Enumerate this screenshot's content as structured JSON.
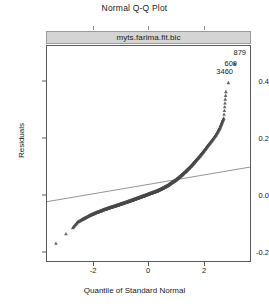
{
  "title": "Normal Q-Q Plot",
  "strip": {
    "label": "myts.farima.fit.bic"
  },
  "axes": {
    "ylabel": "Residuals",
    "xlabel": "Quantile of Standard Normal",
    "yticks": [
      "0.4",
      "0.2",
      "0.0",
      "-0.2"
    ],
    "xticks": [
      "-2",
      "0",
      "2"
    ]
  },
  "point_labels": [
    {
      "text": "879"
    },
    {
      "text": "609"
    },
    {
      "text": "3460"
    }
  ],
  "chart_data": {
    "type": "scatter",
    "title": "Normal Q-Q Plot",
    "subtitle": "myts.farima.fit.bic",
    "xlabel": "Quantile of Standard Normal",
    "ylabel": "Residuals",
    "xlim": [
      -3.75,
      3.75
    ],
    "ylim": [
      -0.27,
      0.52
    ],
    "xticks": [
      -2,
      0,
      2
    ],
    "yticks": [
      -0.2,
      0.0,
      0.2,
      0.4
    ],
    "grid": false,
    "legend": null,
    "marker": "triangle",
    "marker_color": "#4a4a4a",
    "reference_line": {
      "type": "qqline",
      "x": [
        -3.75,
        3.75
      ],
      "y": [
        -0.052,
        0.075
      ],
      "color": "#7a7a7a"
    },
    "labeled_points": [
      {
        "label": "879",
        "x": 3.18,
        "y": 0.455
      },
      {
        "label": "609",
        "x": 2.95,
        "y": 0.385
      },
      {
        "label": "3460",
        "x": 2.86,
        "y": 0.352
      }
    ],
    "points": [
      {
        "x": -3.42,
        "y": -0.205
      },
      {
        "x": -3.05,
        "y": -0.17
      },
      {
        "x": -2.8,
        "y": -0.148
      },
      {
        "x": -2.62,
        "y": -0.127
      },
      {
        "x": -2.47,
        "y": -0.118
      },
      {
        "x": -2.35,
        "y": -0.112
      },
      {
        "x": -2.24,
        "y": -0.106
      },
      {
        "x": -2.14,
        "y": -0.101
      },
      {
        "x": -2.05,
        "y": -0.097
      },
      {
        "x": -1.96,
        "y": -0.093
      },
      {
        "x": -1.88,
        "y": -0.09
      },
      {
        "x": -1.8,
        "y": -0.087
      },
      {
        "x": -1.72,
        "y": -0.084
      },
      {
        "x": -1.65,
        "y": -0.081
      },
      {
        "x": -1.58,
        "y": -0.079
      },
      {
        "x": -1.51,
        "y": -0.076
      },
      {
        "x": -1.44,
        "y": -0.074
      },
      {
        "x": -1.38,
        "y": -0.072
      },
      {
        "x": -1.31,
        "y": -0.07
      },
      {
        "x": -1.25,
        "y": -0.068
      },
      {
        "x": -1.19,
        "y": -0.066
      },
      {
        "x": -1.13,
        "y": -0.064
      },
      {
        "x": -1.07,
        "y": -0.062
      },
      {
        "x": -1.01,
        "y": -0.06
      },
      {
        "x": -0.95,
        "y": -0.058
      },
      {
        "x": -0.89,
        "y": -0.056
      },
      {
        "x": -0.83,
        "y": -0.054
      },
      {
        "x": -0.77,
        "y": -0.052
      },
      {
        "x": -0.72,
        "y": -0.05
      },
      {
        "x": -0.66,
        "y": -0.048
      },
      {
        "x": -0.6,
        "y": -0.046
      },
      {
        "x": -0.55,
        "y": -0.044
      },
      {
        "x": -0.49,
        "y": -0.042
      },
      {
        "x": -0.44,
        "y": -0.04
      },
      {
        "x": -0.38,
        "y": -0.038
      },
      {
        "x": -0.33,
        "y": -0.036
      },
      {
        "x": -0.27,
        "y": -0.034
      },
      {
        "x": -0.22,
        "y": -0.032
      },
      {
        "x": -0.16,
        "y": -0.03
      },
      {
        "x": -0.11,
        "y": -0.028
      },
      {
        "x": -0.05,
        "y": -0.026
      },
      {
        "x": 0.0,
        "y": -0.024
      },
      {
        "x": 0.05,
        "y": -0.022
      },
      {
        "x": 0.11,
        "y": -0.02
      },
      {
        "x": 0.16,
        "y": -0.018
      },
      {
        "x": 0.22,
        "y": -0.016
      },
      {
        "x": 0.27,
        "y": -0.014
      },
      {
        "x": 0.33,
        "y": -0.012
      },
      {
        "x": 0.38,
        "y": -0.009
      },
      {
        "x": 0.44,
        "y": -0.007
      },
      {
        "x": 0.49,
        "y": -0.004
      },
      {
        "x": 0.55,
        "y": -0.001
      },
      {
        "x": 0.6,
        "y": 0.002
      },
      {
        "x": 0.66,
        "y": 0.005
      },
      {
        "x": 0.72,
        "y": 0.008
      },
      {
        "x": 0.77,
        "y": 0.012
      },
      {
        "x": 0.83,
        "y": 0.016
      },
      {
        "x": 0.89,
        "y": 0.02
      },
      {
        "x": 0.95,
        "y": 0.024
      },
      {
        "x": 1.01,
        "y": 0.028
      },
      {
        "x": 1.07,
        "y": 0.033
      },
      {
        "x": 1.13,
        "y": 0.038
      },
      {
        "x": 1.19,
        "y": 0.043
      },
      {
        "x": 1.25,
        "y": 0.048
      },
      {
        "x": 1.31,
        "y": 0.054
      },
      {
        "x": 1.38,
        "y": 0.06
      },
      {
        "x": 1.44,
        "y": 0.066
      },
      {
        "x": 1.51,
        "y": 0.073
      },
      {
        "x": 1.58,
        "y": 0.08
      },
      {
        "x": 1.65,
        "y": 0.088
      },
      {
        "x": 1.72,
        "y": 0.096
      },
      {
        "x": 1.8,
        "y": 0.105
      },
      {
        "x": 1.88,
        "y": 0.114
      },
      {
        "x": 1.96,
        "y": 0.124
      },
      {
        "x": 2.05,
        "y": 0.135
      },
      {
        "x": 2.14,
        "y": 0.147
      },
      {
        "x": 2.24,
        "y": 0.16
      },
      {
        "x": 2.35,
        "y": 0.174
      },
      {
        "x": 2.47,
        "y": 0.19
      },
      {
        "x": 2.56,
        "y": 0.205
      },
      {
        "x": 2.64,
        "y": 0.22
      },
      {
        "x": 2.71,
        "y": 0.238
      },
      {
        "x": 2.78,
        "y": 0.255
      },
      {
        "x": 2.86,
        "y": 0.352
      },
      {
        "x": 2.95,
        "y": 0.385
      },
      {
        "x": 3.18,
        "y": 0.455
      }
    ]
  }
}
